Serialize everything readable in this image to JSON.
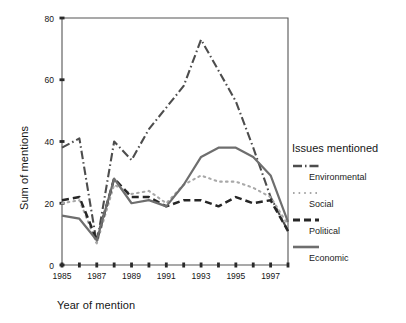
{
  "chart_data": {
    "type": "line",
    "title": "",
    "xlabel": "Year of mention",
    "ylabel": "Sum of mentions",
    "xlim": [
      1985,
      1998
    ],
    "ylim": [
      0,
      80
    ],
    "yticks": [
      0,
      20,
      40,
      60,
      80
    ],
    "xticks": [
      1985,
      1986,
      1987,
      1988,
      1989,
      1990,
      1991,
      1992,
      1993,
      1994,
      1995,
      1996,
      1997,
      1998
    ],
    "xtick_labels": [
      "1985",
      "",
      "1987",
      "",
      "1989",
      "",
      "1991",
      "",
      "1993",
      "",
      "1995",
      "",
      "1997",
      ""
    ],
    "grid": false,
    "legend_position": "right",
    "legend_title": "Issues mentioned",
    "x": [
      1985,
      1986,
      1987,
      1988,
      1989,
      1990,
      1991,
      1992,
      1993,
      1994,
      1995,
      1996,
      1997,
      1998
    ],
    "series": [
      {
        "name": "Environmental",
        "style": "dash-dot",
        "color": "#4d4d4d",
        "values": [
          38,
          41,
          7,
          40,
          34,
          44,
          51,
          58,
          73,
          63,
          53,
          38,
          22,
          11
        ]
      },
      {
        "name": "Social",
        "style": "dotted",
        "color": "#a8a8a8",
        "values": [
          20,
          21,
          7,
          26,
          23,
          24,
          20,
          26,
          29,
          27,
          27,
          25,
          22,
          13
        ]
      },
      {
        "name": "Political",
        "style": "dashed",
        "color": "#262626",
        "values": [
          21,
          22,
          8,
          28,
          22,
          22,
          19,
          21,
          21,
          19,
          22,
          20,
          21,
          11
        ]
      },
      {
        "name": "Economic",
        "style": "solid",
        "color": "#6e6e6e",
        "values": [
          16,
          15,
          8,
          28,
          20,
          21,
          19,
          26,
          35,
          38,
          38,
          35,
          29,
          14
        ]
      }
    ]
  },
  "legend": {
    "title": "Issues mentioned",
    "entries": [
      {
        "label": "Environmental"
      },
      {
        "label": "Social"
      },
      {
        "label": "Political"
      },
      {
        "label": "Economic"
      }
    ]
  },
  "axes": {
    "x_title": "Year of mention",
    "y_title": "Sum of mentions"
  }
}
